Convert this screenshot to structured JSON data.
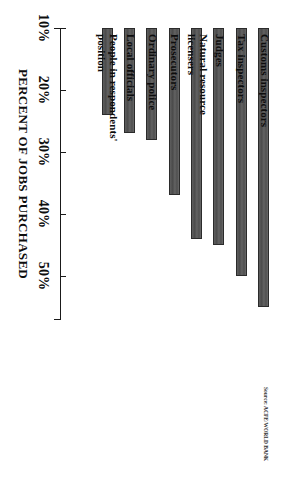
{
  "figure": {
    "orientation": "rotated-90-clockwise",
    "background_color": "#ffffff",
    "bar_color": "#575757",
    "axis_color": "#1a1a1a",
    "source_note": "Source: ACFE/WORLD BANK"
  },
  "chart_data": {
    "type": "bar",
    "title": "",
    "xlabel": "",
    "ylabel": "PERCENT OF JOBS PURCHASED",
    "ylim": [
      10,
      57
    ],
    "grid": false,
    "legend": "none",
    "categories": [
      "Customs inspectors",
      "Tax inspectors",
      "Judges",
      "Natural resource licensers",
      "Prosecutors",
      "Ordinary police",
      "Local officials",
      "People in respondents' position"
    ],
    "values": [
      55,
      50,
      45,
      44,
      37,
      28,
      27,
      24
    ],
    "tick_labels": [
      "10%",
      "20%",
      "30%",
      "40%",
      "50%"
    ],
    "tick_values": [
      10,
      20,
      30,
      40,
      50
    ]
  },
  "axis": {
    "title": "PERCENT OF JOBS PURCHASED",
    "ticks": [
      {
        "label": "10%",
        "value": 10
      },
      {
        "label": "20%",
        "value": 20
      },
      {
        "label": "30%",
        "value": 30
      },
      {
        "label": "40%",
        "value": 40
      },
      {
        "label": "50%",
        "value": 50
      }
    ]
  },
  "bars": [
    {
      "label": "Customs inspectors",
      "value": 55
    },
    {
      "label": "Tax inspectors",
      "value": 50
    },
    {
      "label": "Judges",
      "value": 45
    },
    {
      "label": "Natural resource licensers",
      "value": 44
    },
    {
      "label": "Prosecutors",
      "value": 37
    },
    {
      "label": "Ordinary police",
      "value": 28
    },
    {
      "label": "Local officials",
      "value": 27
    },
    {
      "label": "People in respondents' position",
      "value": 24
    }
  ],
  "labels": {
    "b0": "Customs inspectors",
    "b1": "Tax inspectors",
    "b2": "Judges",
    "b3": "Natural resource licensers",
    "b4": "Prosecutors",
    "b5": "Ordinary police",
    "b6": "Local officials",
    "b7": "People in respondents'\nposition"
  },
  "source": {
    "text": "Source: ACFE/WORLD BANK"
  }
}
